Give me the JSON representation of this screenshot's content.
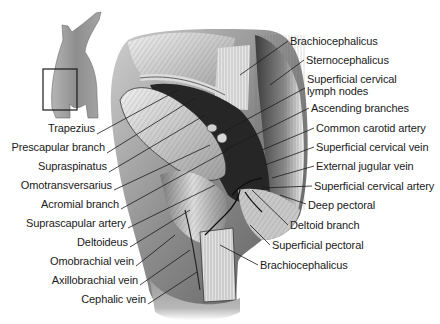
{
  "figure": {
    "type": "anatomical-illustration",
    "locator": {
      "icon": "dog-silhouette-icon",
      "box": "region-of-interest-box"
    }
  },
  "labels_left": [
    {
      "id": "trapezius",
      "text": "Trapezius",
      "x_right": 95,
      "y": 128,
      "line": [
        97,
        134,
        178,
        90
      ]
    },
    {
      "id": "prescapular-branch",
      "text": "Prescapular branch",
      "x_right": 105,
      "y": 147,
      "line": [
        107,
        153,
        195,
        98
      ]
    },
    {
      "id": "supraspinatus",
      "text": "Supraspinatus",
      "x_right": 107,
      "y": 166,
      "line": [
        109,
        172,
        205,
        115
      ]
    },
    {
      "id": "omotransversarius",
      "text": "Omotransversarius",
      "x_right": 112,
      "y": 185,
      "line": [
        114,
        190,
        210,
        145
      ]
    },
    {
      "id": "acromial-branch",
      "text": "Acromial branch",
      "x_right": 119,
      "y": 204,
      "line": [
        121,
        209,
        228,
        150
      ]
    },
    {
      "id": "suprascapular-artery",
      "text": "Suprascapular artery",
      "x_right": 126,
      "y": 223,
      "line": [
        128,
        228,
        215,
        185
      ]
    },
    {
      "id": "deltoideus",
      "text": "Deltoideus",
      "x_right": 128,
      "y": 242,
      "line": [
        130,
        247,
        190,
        210
      ]
    },
    {
      "id": "omobrachial-vein",
      "text": "Omobrachial vein",
      "x_right": 134,
      "y": 261,
      "line": [
        136,
        266,
        175,
        235
      ]
    },
    {
      "id": "axillobrachial-vein",
      "text": "Axillobrachial vein",
      "x_right": 138,
      "y": 280,
      "line": [
        140,
        285,
        190,
        250
      ]
    },
    {
      "id": "cephalic-vein",
      "text": "Cephalic vein",
      "x_right": 146,
      "y": 299,
      "line": [
        148,
        304,
        197,
        272
      ]
    }
  ],
  "labels_right": [
    {
      "id": "brachiocephalicus-top",
      "text": "Brachiocephalicus",
      "x": 290,
      "y": 35,
      "line": [
        288,
        41,
        240,
        75
      ]
    },
    {
      "id": "sternocephalicus",
      "text": "Sternocephalicus",
      "x": 306,
      "y": 54,
      "line": [
        304,
        60,
        270,
        85
      ]
    },
    {
      "id": "superficial-cervical-lymph-nodes",
      "text": "Superficial cervical\nlymph nodes",
      "line1": "Superficial cervical",
      "line2": "lymph nodes",
      "x": 307,
      "y": 73,
      "line": [
        305,
        88,
        218,
        135
      ]
    },
    {
      "id": "ascending-branches",
      "text": "Ascending branches",
      "x": 311,
      "y": 102,
      "line": [
        309,
        108,
        225,
        150
      ]
    },
    {
      "id": "common-carotid-artery",
      "text": "Common carotid artery",
      "x": 316,
      "y": 122,
      "line": [
        314,
        128,
        262,
        150
      ]
    },
    {
      "id": "superficial-cervical-vein",
      "text": "Superficial cervical vein",
      "x": 316,
      "y": 141,
      "line": [
        314,
        147,
        265,
        165
      ]
    },
    {
      "id": "external-jugular-vein",
      "text": "External jugular vein",
      "x": 316,
      "y": 160,
      "line": [
        314,
        166,
        272,
        178
      ]
    },
    {
      "id": "superficial-cervical-artery",
      "text": "Superficial cervical artery",
      "x": 314,
      "y": 180,
      "line": [
        312,
        186,
        262,
        188
      ]
    },
    {
      "id": "deep-pectoral",
      "text": "Deep pectoral",
      "x": 308,
      "y": 199,
      "line": [
        306,
        204,
        280,
        195
      ]
    },
    {
      "id": "deltoid-branch",
      "text": "Deltoid branch",
      "x": 290,
      "y": 219,
      "line": [
        288,
        225,
        252,
        190
      ]
    },
    {
      "id": "superficial-pectoral",
      "text": "Superficial pectoral",
      "x": 272,
      "y": 239,
      "line": [
        270,
        245,
        250,
        225
      ]
    },
    {
      "id": "brachiocephalicus-bottom",
      "text": "Brachiocephalicus",
      "x": 260,
      "y": 259,
      "line": [
        258,
        265,
        220,
        245
      ]
    }
  ],
  "colors": {
    "background": "#ffffff",
    "text": "#1a1a1a",
    "leader": "#1a1a1a",
    "muscle_light": "#d8d8d8",
    "muscle_mid": "#9a9a9a",
    "muscle_dark": "#4a4a4a",
    "vessel": "#111111",
    "silhouette": "#8c8c8c"
  }
}
